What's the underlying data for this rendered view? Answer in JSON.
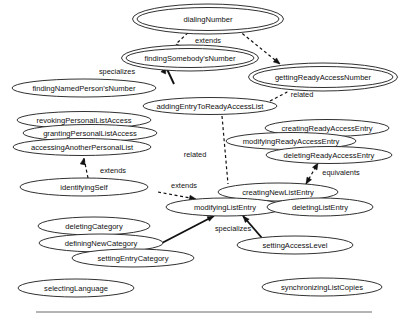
{
  "diagram": {
    "type": "use-case-relationship-diagram",
    "title": "",
    "stroke_color": "#111111",
    "fill_color": "#ffffff",
    "background": "#ffffff",
    "footer_rule": {
      "x1": 36,
      "y1": 312,
      "x2": 372,
      "y2": 312
    },
    "nodes": [
      {
        "id": "dialingNumber",
        "label": "dialingNumber",
        "cx": 208,
        "cy": 19,
        "rx": 71,
        "ry": 11.5,
        "double": true
      },
      {
        "id": "findingSomebodysNumber",
        "label": "findingSomebody'sNumber",
        "cx": 190,
        "cy": 58,
        "rx": 64,
        "ry": 9.5,
        "double": true
      },
      {
        "id": "gettingReadyAccessNumber",
        "label": "gettingReadyAccessNumber",
        "cx": 323,
        "cy": 77,
        "rx": 70,
        "ry": 10.5,
        "double": true
      },
      {
        "id": "findingNamedPersonsNumber",
        "label": "findingNamedPerson'sNumber",
        "cx": 84,
        "cy": 88,
        "rx": 72,
        "ry": 9,
        "double": false
      },
      {
        "id": "addingEntryToReadyAccessList",
        "label": "addingEntryToReadyAccessList",
        "cx": 210,
        "cy": 106,
        "rx": 67,
        "ry": 8.5,
        "double": false
      },
      {
        "id": "revokingPersonalListAccess",
        "label": "revokingPersonalListAccess",
        "cx": 84,
        "cy": 120,
        "rx": 67,
        "ry": 8.5,
        "double": false
      },
      {
        "id": "grantingPersonalListAccess",
        "label": "grantingPersonalListAccess",
        "cx": 90,
        "cy": 133,
        "rx": 67,
        "ry": 8.5,
        "double": false
      },
      {
        "id": "accessingAnotherPersonalList",
        "label": "accessingAnotherPersonalList",
        "cx": 82,
        "cy": 147,
        "rx": 69,
        "ry": 8.5,
        "double": false
      },
      {
        "id": "creatingReadyAccessEntry",
        "label": "creatingReadyAccessEntry",
        "cx": 327,
        "cy": 128,
        "rx": 62,
        "ry": 8.5,
        "double": false
      },
      {
        "id": "modifyingReadyAccessEntry",
        "label": "modifyingReadyAccessEntry",
        "cx": 291,
        "cy": 141,
        "rx": 65,
        "ry": 8.5,
        "double": false
      },
      {
        "id": "deletingReadyAccessEntry",
        "label": "deletingReadyAccessEntry",
        "cx": 329,
        "cy": 155,
        "rx": 63,
        "ry": 8.5,
        "double": false
      },
      {
        "id": "identifyingSelf",
        "label": "identifyingSelf",
        "cx": 84,
        "cy": 187,
        "rx": 64,
        "ry": 9,
        "double": false
      },
      {
        "id": "creatingNewListEntry",
        "label": "creatingNewListEntry",
        "cx": 278,
        "cy": 192,
        "rx": 60,
        "ry": 9,
        "double": false
      },
      {
        "id": "modifyingListEntry",
        "label": "modifyingListEntry",
        "cx": 225,
        "cy": 207,
        "rx": 59,
        "ry": 9,
        "double": false
      },
      {
        "id": "deletingListEntry",
        "label": "deletingListEntry",
        "cx": 320,
        "cy": 207,
        "rx": 53,
        "ry": 9,
        "double": false
      },
      {
        "id": "deletingCategory",
        "label": "deletingCategory",
        "cx": 94,
        "cy": 226,
        "rx": 56,
        "ry": 9,
        "double": false
      },
      {
        "id": "definingNewCategory",
        "label": "definingNewCategory",
        "cx": 101,
        "cy": 243,
        "rx": 62,
        "ry": 9,
        "double": false
      },
      {
        "id": "settingEntryCategory",
        "label": "settingEntryCategory",
        "cx": 133,
        "cy": 258,
        "rx": 61,
        "ry": 9,
        "double": false
      },
      {
        "id": "settingAccessLevel",
        "label": "settingAccessLevel",
        "cx": 295,
        "cy": 245,
        "rx": 58,
        "ry": 9,
        "double": false
      },
      {
        "id": "selectingLanguage",
        "label": "selectingLanguage",
        "cx": 76,
        "cy": 288,
        "rx": 58,
        "ry": 9,
        "double": false
      },
      {
        "id": "synchronizingListCopies",
        "label": "synchronizingListCopies",
        "cx": 322,
        "cy": 287,
        "rx": 60,
        "ry": 9,
        "double": false
      }
    ],
    "edges": [
      {
        "id": "dialing-extends-findingSomebodys",
        "label": "extends",
        "style": "dashed",
        "arrow": "single",
        "label_x": 208,
        "label_y": 41,
        "path": "M 192 29 L 176 44",
        "head": {
          "x": 176,
          "y": 44,
          "angle": 223
        }
      },
      {
        "id": "dialing-to-gettingReady",
        "label": "",
        "style": "dashed",
        "arrow": "single",
        "label_x": 0,
        "label_y": 0,
        "path": "M 238 30 L 280 64",
        "head": {
          "x": 280,
          "y": 64,
          "angle": 39
        }
      },
      {
        "id": "findingNamed-specializes-findingSomebodys",
        "label": "specializes",
        "style": "solid",
        "arrow": "single",
        "label_x": 117,
        "label_y": 72,
        "path": "M 174 84 L 166 67",
        "head": {
          "x": 166,
          "y": 67,
          "angle": -65
        }
      },
      {
        "id": "gettingReady-related-addingEntry",
        "label": "related",
        "style": "dashed",
        "arrow": "none",
        "label_x": 302,
        "label_y": 95,
        "path": "M 270 101 L 295 88"
      },
      {
        "id": "addingEntry-related-creatingNewListEntry",
        "label": "related",
        "style": "dashed",
        "arrow": "none",
        "label_x": 195,
        "label_y": 155,
        "path": "M 222 116 L 228 184"
      },
      {
        "id": "identifyingSelf-extends-accessingAnother",
        "label": "extends",
        "style": "dashed",
        "arrow": "single",
        "label_x": 113,
        "label_y": 171,
        "path": "M 88 178 L 84 158",
        "head": {
          "x": 84,
          "y": 158,
          "angle": -79
        }
      },
      {
        "id": "identifyingSelf-extends-creatingNewListEntry",
        "label": "extends",
        "style": "dashed",
        "arrow": "single",
        "label_x": 184,
        "label_y": 186,
        "path": "M 158 192 L 196 199",
        "head": {
          "x": 196,
          "y": 199,
          "angle": 11
        }
      },
      {
        "id": "deletingReadyAccessEntry-equivalents-creatingNewListEntry",
        "label": "equivalents",
        "style": "dashed",
        "arrow": "double",
        "label_x": 341,
        "label_y": 173,
        "path": "M 306 184 L 318 163",
        "head": {
          "x": 318,
          "y": 163,
          "angle": -60
        },
        "tail": {
          "x": 306,
          "y": 184,
          "angle": 120
        }
      },
      {
        "id": "definingNewCategory-specializes-modifyingListEntry",
        "label": "specializes",
        "style": "solid",
        "arrow": "single",
        "label_x": 233,
        "label_y": 229,
        "path": "M 160 244 L 214 216",
        "head": {
          "x": 214,
          "y": 216,
          "angle": -27
        }
      },
      {
        "id": "settingAccessLevel-specializes-modifyingListEntry",
        "label": "",
        "style": "solid",
        "arrow": "single",
        "label_x": 0,
        "label_y": 0,
        "path": "M 262 238 L 243 216",
        "head": {
          "x": 243,
          "y": 216,
          "angle": -131
        }
      }
    ]
  }
}
